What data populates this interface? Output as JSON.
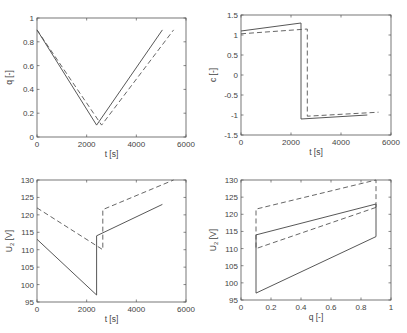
{
  "chart_data": [
    {
      "type": "line",
      "id": "q-vs-t",
      "title": "",
      "xlabel": "t [s]",
      "ylabel": "q [-]",
      "xlim": [
        0,
        6000
      ],
      "ylim": [
        0,
        1
      ],
      "xticks": [
        0,
        2000,
        4000,
        6000
      ],
      "yticks": [
        0,
        0.2,
        0.4,
        0.6,
        0.8,
        1
      ],
      "ytick_labels": [
        "0",
        "0.2",
        "0.4",
        "0.6",
        "0.8",
        "1"
      ],
      "grid": false,
      "box": {
        "x0": 37,
        "y0": 18,
        "x1": 186,
        "y1": 137
      },
      "series": [
        {
          "name": "solid",
          "style": "solid",
          "x": [
            0,
            2400,
            5050
          ],
          "y": [
            0.9,
            0.1,
            0.9
          ]
        },
        {
          "name": "dashed",
          "style": "dashed",
          "x": [
            0,
            2600,
            5500
          ],
          "y": [
            0.9,
            0.1,
            0.9
          ]
        }
      ]
    },
    {
      "type": "line",
      "id": "c-vs-t",
      "title": "",
      "xlabel": "t [s]",
      "ylabel": "c [-]",
      "xlim": [
        0,
        6000
      ],
      "ylim": [
        -1.5,
        1.5
      ],
      "xticks": [
        0,
        2000,
        4000,
        6000
      ],
      "yticks": [
        -1.5,
        -1,
        -0.5,
        0,
        0.5,
        1,
        1.5
      ],
      "ytick_labels": [
        "-1.5",
        "-1",
        "-0.5",
        "0",
        "0.5",
        "1",
        "1.5"
      ],
      "grid": false,
      "box": {
        "x0": 241,
        "y0": 15,
        "x1": 391,
        "y1": 135
      },
      "series": [
        {
          "name": "solid",
          "style": "solid",
          "x": [
            0,
            2400,
            2400,
            5050
          ],
          "y": [
            1.1,
            1.3,
            -1.1,
            -1.0
          ]
        },
        {
          "name": "dashed",
          "style": "dashed",
          "x": [
            0,
            2650,
            2650,
            5500
          ],
          "y": [
            1.03,
            1.15,
            -1.03,
            -0.93
          ]
        }
      ]
    },
    {
      "type": "line",
      "id": "u2-vs-t",
      "title": "",
      "xlabel": "t [s]",
      "ylabel": "U2 [V]",
      "xlim": [
        0,
        6000
      ],
      "ylim": [
        95,
        130
      ],
      "xticks": [
        0,
        2000,
        4000,
        6000
      ],
      "yticks": [
        95,
        100,
        105,
        110,
        115,
        120,
        125,
        130
      ],
      "ytick_labels": [
        "95",
        "100",
        "105",
        "110",
        "115",
        "120",
        "125",
        "130"
      ],
      "grid": false,
      "box": {
        "x0": 37,
        "y0": 180,
        "x1": 186,
        "y1": 302
      },
      "series": [
        {
          "name": "solid",
          "style": "solid",
          "x": [
            0,
            2400,
            2400,
            5050
          ],
          "y": [
            113,
            97,
            114,
            123
          ]
        },
        {
          "name": "dashed",
          "style": "dashed",
          "x": [
            0,
            2650,
            2650,
            5500
          ],
          "y": [
            122,
            110,
            121.5,
            130
          ]
        }
      ]
    },
    {
      "type": "line",
      "id": "u2-vs-q",
      "title": "",
      "xlabel": "q [-]",
      "ylabel": "U2 [V]",
      "xlim": [
        0,
        1
      ],
      "ylim": [
        95,
        130
      ],
      "xticks": [
        0,
        0.2,
        0.4,
        0.6,
        0.8,
        1
      ],
      "xtick_labels": [
        "0",
        "0.2",
        "0.4",
        "0.6",
        "0.8",
        "1"
      ],
      "yticks": [
        95,
        100,
        105,
        110,
        115,
        120,
        125,
        130
      ],
      "ytick_labels": [
        "95",
        "100",
        "105",
        "110",
        "115",
        "120",
        "125",
        "130"
      ],
      "grid": false,
      "box": {
        "x0": 241,
        "y0": 180,
        "x1": 391,
        "y1": 300
      },
      "series": [
        {
          "name": "solid",
          "style": "solid",
          "x": [
            0.9,
            0.1,
            0.1,
            0.9,
            0.9
          ],
          "y": [
            113.5,
            97,
            114,
            123,
            113.5
          ]
        },
        {
          "name": "dashed",
          "style": "dashed",
          "x": [
            0.9,
            0.1,
            0.1,
            0.9,
            0.9
          ],
          "y": [
            122,
            110,
            121.5,
            130,
            122
          ]
        }
      ]
    }
  ]
}
